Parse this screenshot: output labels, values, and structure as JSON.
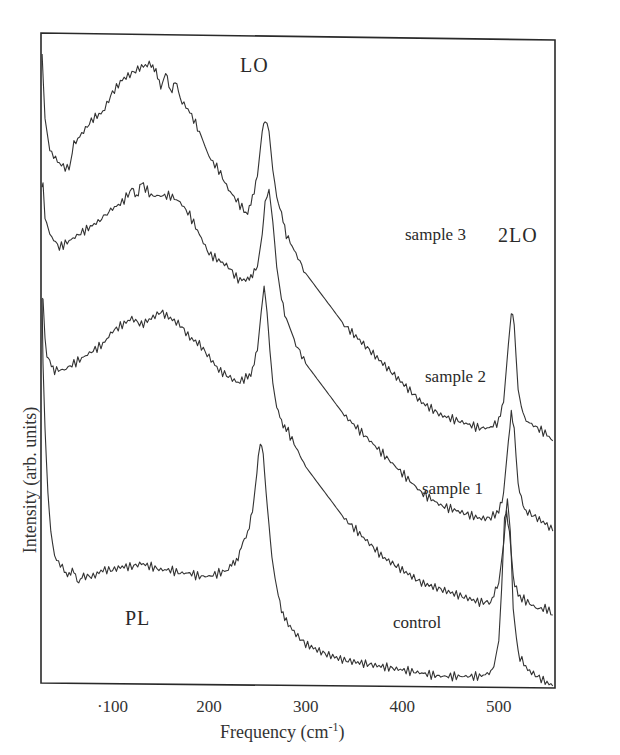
{
  "chart_data": {
    "type": "line",
    "title": "",
    "xlabel": "Frequency (cm-1)",
    "xlabel_main": "Frequency (cm",
    "xlabel_sup": "-1",
    "xlabel_close": ")",
    "ylabel": "Intensity (arb. units)",
    "xlim": [
      25,
      558
    ],
    "ylim": [
      0,
      100
    ],
    "x_ticks": [
      100,
      200,
      300,
      400,
      500
    ],
    "x_tick_labels": [
      "·100",
      "200",
      "300",
      "400",
      "500"
    ],
    "y_ticks": [],
    "grid": false,
    "legend": "none (curves labelled inline)",
    "annotations": [
      {
        "text": "LO",
        "x": 265,
        "y": 98
      },
      {
        "text": "2LO",
        "x": 515,
        "y": 70
      },
      {
        "text": "PL",
        "x": 150,
        "y": 13
      },
      {
        "text": "sample 3",
        "x": 420,
        "y": 71
      },
      {
        "text": "sample 2",
        "x": 420,
        "y": 49
      },
      {
        "text": "sample 1",
        "x": 415,
        "y": 31
      },
      {
        "text": "control",
        "x": 395,
        "y": 11
      }
    ],
    "series": [
      {
        "name": "sample 3",
        "x": [
          27,
          30,
          35,
          45,
          55,
          60,
          70,
          80,
          90,
          100,
          110,
          120,
          130,
          140,
          145,
          150,
          155,
          160,
          165,
          170,
          180,
          190,
          200,
          210,
          220,
          230,
          240,
          245,
          250,
          255,
          258,
          262,
          266,
          270,
          275,
          280,
          290,
          300,
          320,
          340,
          360,
          380,
          400,
          420,
          440,
          460,
          480,
          490,
          500,
          505,
          510,
          513,
          516,
          520,
          525,
          530,
          540,
          550,
          556
        ],
        "y": [
          98,
          88,
          83,
          81,
          80,
          84,
          86,
          88,
          89,
          92,
          94,
          95,
          96,
          96.5,
          95,
          93,
          95,
          92,
          94,
          91,
          89,
          86,
          82,
          80,
          77,
          75,
          73,
          76,
          79,
          86,
          88,
          86,
          80,
          76,
          73,
          70,
          67,
          64,
          60,
          56,
          53,
          50,
          47,
          44,
          42,
          41,
          40,
          40,
          41,
          44,
          53,
          58,
          56,
          46,
          42,
          41,
          40,
          39,
          38
        ]
      },
      {
        "name": "sample 2",
        "x": [
          27,
          28,
          30,
          35,
          45,
          55,
          65,
          75,
          85,
          100,
          110,
          120,
          125,
          130,
          140,
          150,
          160,
          170,
          180,
          190,
          200,
          210,
          220,
          230,
          240,
          245,
          250,
          255,
          258,
          262,
          266,
          270,
          275,
          280,
          290,
          300,
          320,
          340,
          360,
          380,
          400,
          420,
          440,
          460,
          480,
          490,
          500,
          505,
          510,
          513,
          516,
          520,
          525,
          530,
          540,
          550,
          556
        ],
        "y": [
          78,
          78,
          73,
          70,
          68,
          69,
          70,
          71,
          72,
          74,
          75,
          77,
          76,
          78,
          76,
          76,
          76,
          75,
          73,
          70,
          67,
          66,
          65,
          63,
          63,
          64,
          65,
          70,
          75,
          77,
          72,
          65,
          60,
          57,
          53,
          50,
          46,
          42,
          39,
          36,
          33,
          30,
          28,
          27,
          26,
          26,
          27,
          30,
          38,
          42,
          40,
          31,
          28,
          27,
          26,
          25,
          24
        ]
      },
      {
        "name": "sample 1",
        "x": [
          27,
          28,
          30,
          32,
          35,
          40,
          50,
          60,
          70,
          80,
          90,
          100,
          110,
          120,
          130,
          140,
          150,
          160,
          170,
          180,
          190,
          200,
          210,
          220,
          230,
          240,
          245,
          250,
          254,
          257,
          260,
          263,
          266,
          270,
          275,
          280,
          290,
          300,
          320,
          340,
          360,
          380,
          400,
          420,
          440,
          460,
          480,
          490,
          495,
          500,
          505,
          508,
          511,
          515,
          520,
          530,
          540,
          550,
          556
        ],
        "y": [
          60,
          60,
          54,
          51,
          50,
          49,
          49,
          50,
          51,
          52,
          53,
          55,
          56,
          57,
          56,
          57,
          58,
          57,
          56,
          54,
          53,
          51,
          49,
          48,
          47,
          48,
          49,
          52,
          58,
          62,
          58,
          52,
          47,
          43,
          41,
          40,
          37,
          34,
          30,
          26,
          23,
          20,
          18,
          16,
          15,
          14,
          13,
          13,
          14,
          16,
          22,
          27,
          24,
          17,
          14,
          13,
          12,
          12,
          11
        ]
      },
      {
        "name": "control",
        "x": [
          27,
          28,
          30,
          33,
          36,
          40,
          50,
          55,
          60,
          65,
          70,
          80,
          90,
          100,
          110,
          120,
          130,
          140,
          150,
          160,
          170,
          180,
          190,
          200,
          210,
          220,
          225,
          230,
          235,
          240,
          245,
          248,
          251,
          253,
          256,
          259,
          262,
          265,
          270,
          275,
          280,
          290,
          300,
          320,
          340,
          360,
          380,
          400,
          420,
          440,
          460,
          480,
          490,
          495,
          500,
          503,
          506,
          509,
          512,
          515,
          520,
          530,
          540,
          550,
          556
        ],
        "y": [
          60,
          50,
          40,
          30,
          24,
          20,
          18,
          17,
          18,
          16,
          17,
          17,
          18,
          18,
          18.5,
          18.5,
          19,
          18.5,
          18,
          18,
          17.5,
          17.5,
          17,
          17,
          17.5,
          18,
          19,
          20,
          22,
          24,
          27,
          31,
          35,
          38,
          36,
          30,
          25,
          20,
          15,
          12,
          10,
          8,
          6.5,
          5,
          4,
          3.5,
          3,
          2.5,
          2,
          1.5,
          1.5,
          1.5,
          2,
          3,
          7,
          15,
          26,
          29,
          24,
          12,
          5,
          2.5,
          1.5,
          0.5,
          0
        ]
      }
    ]
  },
  "labels": {
    "lo": "LO",
    "two_lo": "2LO",
    "pl": "PL",
    "sample3": "sample 3",
    "sample2": "sample 2",
    "sample1": "sample 1",
    "control": "control"
  }
}
